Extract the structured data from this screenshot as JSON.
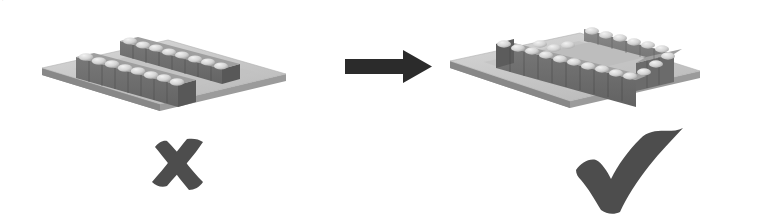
{
  "figure": {
    "background_color": "#ffffff",
    "width": 768,
    "height": 218
  },
  "palette": {
    "plate_top": "#c9c9c9",
    "plate_top_light": "#d6d6d6",
    "plate_edge_front": "#9a9a9a",
    "plate_edge_side": "#8c8c8c",
    "plate_inset": "#bdbdbd",
    "block_front": "#6e6e6e",
    "block_side": "#5c5c5c",
    "block_top": "#a8a8a8",
    "bump_light": "#e2e2e2",
    "bump_shadow": "#9d9d9d",
    "mark_ink": "#4a4a4a",
    "arrow_fill": "#2b2b2b",
    "outline": "#7a7a7a"
  },
  "left_panel": {
    "name": "incorrect-layout",
    "label": "Incorrect arrangement",
    "description": "Two separate parallel rows of bumped blocks on a substrate plate",
    "verdict_symbol": "cross",
    "verdict_text": "✗",
    "verdict_meaning": "incorrect",
    "row_count": 2,
    "blocks_per_row": 8,
    "rows_connected": false
  },
  "arrow": {
    "name": "transform-arrow",
    "direction": "right",
    "label": "leads to",
    "color": "#2b2b2b",
    "shaft": {
      "x": 345,
      "y": 59,
      "width": 58,
      "height": 15
    },
    "head": {
      "x": 400,
      "y": 50,
      "width": 32,
      "height": 33
    }
  },
  "right_panel": {
    "name": "correct-layout",
    "label": "Correct arrangement",
    "description": "Blocks joined into one continuous closed ring loop on the substrate plate",
    "verdict_symbol": "check",
    "verdict_text": "✓",
    "verdict_meaning": "correct",
    "row_count": 1,
    "blocks_per_row": 22,
    "rows_connected": true
  }
}
